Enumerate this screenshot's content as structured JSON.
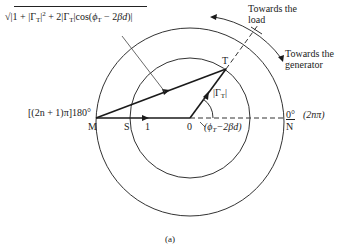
{
  "diagram": {
    "caption": "(a)",
    "formula": {
      "radical": "√",
      "text_parts": [
        "|1 + |Γ",
        "T",
        "|",
        "2",
        " + 2|Γ",
        "T",
        "|cos(",
        "ϕ",
        "T",
        " − 2",
        "βd",
        ")|"
      ]
    },
    "labels": {
      "towards_load_line1": "Towards the",
      "towards_load_line2": "load",
      "towards_generator_line1": "Towards the",
      "towards_generator_line2": "generator",
      "point_T": "T",
      "point_M": "M",
      "point_S": "S",
      "point_N": "N",
      "unit_1": "1",
      "origin_0": "0",
      "gamma_main": "|Γ",
      "gamma_sub": "T",
      "gamma_close": "|",
      "left_angle": "[(2n + 1)π]180°",
      "right_angle_deg": "0°",
      "right_angle_rad": "(2nπ)",
      "angle_phi": "(ϕ",
      "angle_sub": "T",
      "angle_rest": "−2βd)"
    },
    "geometry": {
      "center": [
        190,
        118
      ],
      "outer_radius": 94,
      "inner_radius": 60,
      "point_T": [
        226,
        69
      ]
    },
    "colors": {
      "line": "#1a1a1a",
      "thin_line": "#444444"
    }
  }
}
